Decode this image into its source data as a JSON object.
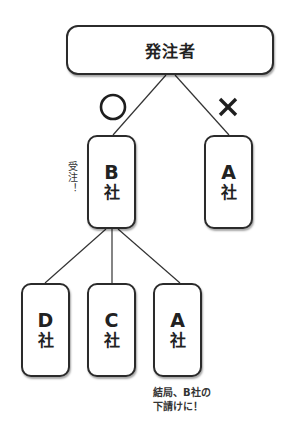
{
  "diagram": {
    "root": {
      "label": "発注者"
    },
    "level1": [
      {
        "id": "b",
        "letter": "B",
        "suffix": "社",
        "mark": "○",
        "mark_meaning": "accepted"
      },
      {
        "id": "a",
        "letter": "A",
        "suffix": "社",
        "mark": "×",
        "mark_meaning": "rejected"
      }
    ],
    "level2": [
      {
        "id": "d",
        "letter": "D",
        "suffix": "社"
      },
      {
        "id": "c",
        "letter": "C",
        "suffix": "社"
      },
      {
        "id": "a2",
        "letter": "A",
        "suffix": "社"
      }
    ],
    "annotations": {
      "order_received": "受注！",
      "outcome_line1": "結局、B社の",
      "outcome_line2": "下請けに！"
    },
    "colors": {
      "stroke": "#2b2b2b",
      "text": "#222222",
      "background": "#ffffff"
    }
  }
}
